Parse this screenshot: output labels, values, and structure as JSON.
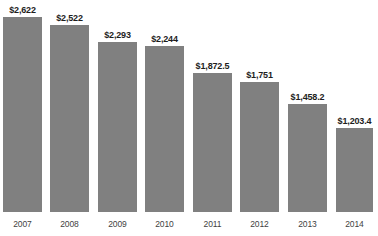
{
  "chart_data": {
    "type": "bar",
    "title": "",
    "subtitle": "",
    "xlabel": "",
    "ylabel": "",
    "categories": [
      "2007",
      "2008",
      "2009",
      "2010",
      "2011",
      "2012",
      "2013",
      "2014"
    ],
    "values": [
      2622,
      2522,
      2293,
      2244,
      1872.5,
      1751,
      1458.2,
      1203.4
    ],
    "value_labels": [
      "$2,622",
      "$2,522",
      "$2,293",
      "$2,244",
      "$1,872.5",
      "$1,751",
      "$1,458.2",
      "$1,203.4"
    ],
    "series": [
      {
        "name": "",
        "values": [
          2622,
          2522,
          2293,
          2244,
          1872.5,
          1751,
          1458.2,
          1203.4
        ]
      }
    ],
    "ylim": [
      0,
      2850
    ],
    "grid": false,
    "legend": false,
    "legend_position": "none",
    "bar_color": "#808080",
    "value_label_color": "#1d1d1d",
    "tick_label_color": "#3f3f3f",
    "background_color": "#ffffff"
  },
  "bars": [
    {
      "category": "2007",
      "value": 2622,
      "label": "$2,622",
      "left": 3,
      "width": 39,
      "height": 195
    },
    {
      "category": "2008",
      "value": 2522,
      "label": "$2,522",
      "left": 50,
      "width": 39,
      "height": 187
    },
    {
      "category": "2009",
      "value": 2293,
      "label": "$2,293",
      "left": 98,
      "width": 39,
      "height": 170
    },
    {
      "category": "2010",
      "value": 2244,
      "label": "$2,244",
      "left": 145,
      "width": 39,
      "height": 166
    },
    {
      "category": "2011",
      "value": 1872.5,
      "label": "$1,872.5",
      "left": 193,
      "width": 39,
      "height": 139
    },
    {
      "category": "2012",
      "value": 1751,
      "label": "$1,751",
      "left": 240,
      "width": 39,
      "height": 130
    },
    {
      "category": "2013",
      "value": 1458.2,
      "label": "$1,458.2",
      "left": 288,
      "width": 39,
      "height": 108
    },
    {
      "category": "2014",
      "value": 1203.4,
      "label": "$1,203.4",
      "left": 336,
      "width": 37,
      "height": 84
    }
  ]
}
